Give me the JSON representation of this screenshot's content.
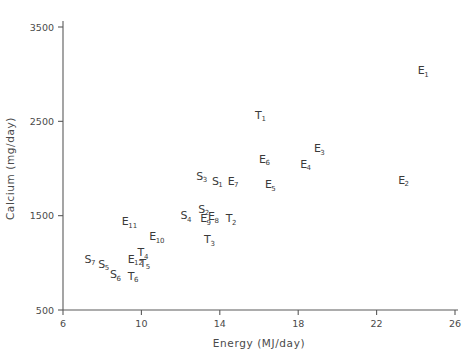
{
  "chart_data": {
    "type": "scatter",
    "title": "",
    "xlabel": "Energy (MJ/day)",
    "ylabel": "Calcium (mg/day)",
    "xlim": [
      6,
      26
    ],
    "ylim": [
      500,
      3500
    ],
    "xticks": [
      6,
      10,
      14,
      18,
      22,
      26
    ],
    "yticks": [
      500,
      1500,
      2500,
      3500
    ],
    "xtick_labels": [
      "6",
      "10",
      "14",
      "18",
      "22",
      "26"
    ],
    "ytick_labels": [
      "500",
      "1500",
      "2500",
      "3500"
    ],
    "grid": false,
    "legend": "none",
    "marker_style": "text-label",
    "points": [
      {
        "label": "E",
        "sub": "1",
        "text": "E1",
        "x": 24.1,
        "y": 3000
      },
      {
        "label": "E",
        "sub": "2",
        "text": "E2",
        "x": 23.1,
        "y": 1840
      },
      {
        "label": "E",
        "sub": "3",
        "text": "E3",
        "x": 18.8,
        "y": 2170
      },
      {
        "label": "E",
        "sub": "4",
        "text": "E4",
        "x": 18.1,
        "y": 2010
      },
      {
        "label": "E",
        "sub": "5",
        "text": "E5",
        "x": 16.3,
        "y": 1790
      },
      {
        "label": "E",
        "sub": "6",
        "text": "E6",
        "x": 16.0,
        "y": 2060
      },
      {
        "label": "E",
        "sub": "7",
        "text": "E7",
        "x": 14.4,
        "y": 1830
      },
      {
        "label": "E",
        "sub": "8",
        "text": "E8",
        "x": 13.4,
        "y": 1450
      },
      {
        "label": "E",
        "sub": "9",
        "text": "E9",
        "x": 13.0,
        "y": 1430
      },
      {
        "label": "E",
        "sub": "10",
        "text": "E10",
        "x": 10.4,
        "y": 1240
      },
      {
        "label": "E",
        "sub": "11",
        "text": "E11",
        "x": 9.0,
        "y": 1400
      },
      {
        "label": "E",
        "sub": "12",
        "text": "E12",
        "x": 9.3,
        "y": 1000
      },
      {
        "label": "S",
        "sub": "1",
        "text": "S1",
        "x": 13.6,
        "y": 1830
      },
      {
        "label": "S",
        "sub": "2",
        "text": "S2",
        "x": 12.9,
        "y": 1530
      },
      {
        "label": "S",
        "sub": "3",
        "text": "S3",
        "x": 12.8,
        "y": 1880
      },
      {
        "label": "S",
        "sub": "4",
        "text": "S4",
        "x": 12.0,
        "y": 1460
      },
      {
        "label": "S",
        "sub": "5",
        "text": "S5",
        "x": 7.8,
        "y": 950
      },
      {
        "label": "S",
        "sub": "6",
        "text": "S6",
        "x": 8.4,
        "y": 840
      },
      {
        "label": "S",
        "sub": "7",
        "text": "S7",
        "x": 7.1,
        "y": 1000
      },
      {
        "label": "T",
        "sub": "1",
        "text": "T1",
        "x": 15.8,
        "y": 2530
      },
      {
        "label": "T",
        "sub": "2",
        "text": "T2",
        "x": 14.3,
        "y": 1430
      },
      {
        "label": "T",
        "sub": "3",
        "text": "T3",
        "x": 13.2,
        "y": 1210
      },
      {
        "label": "T",
        "sub": "4",
        "text": "T4",
        "x": 9.8,
        "y": 1070
      },
      {
        "label": "T",
        "sub": "5",
        "text": "T5",
        "x": 9.9,
        "y": 960
      },
      {
        "label": "T",
        "sub": "6",
        "text": "T6",
        "x": 9.3,
        "y": 820
      }
    ]
  },
  "axes": {
    "x_title": "Energy (MJ/day)",
    "y_title": "Calcium (mg/day)"
  }
}
